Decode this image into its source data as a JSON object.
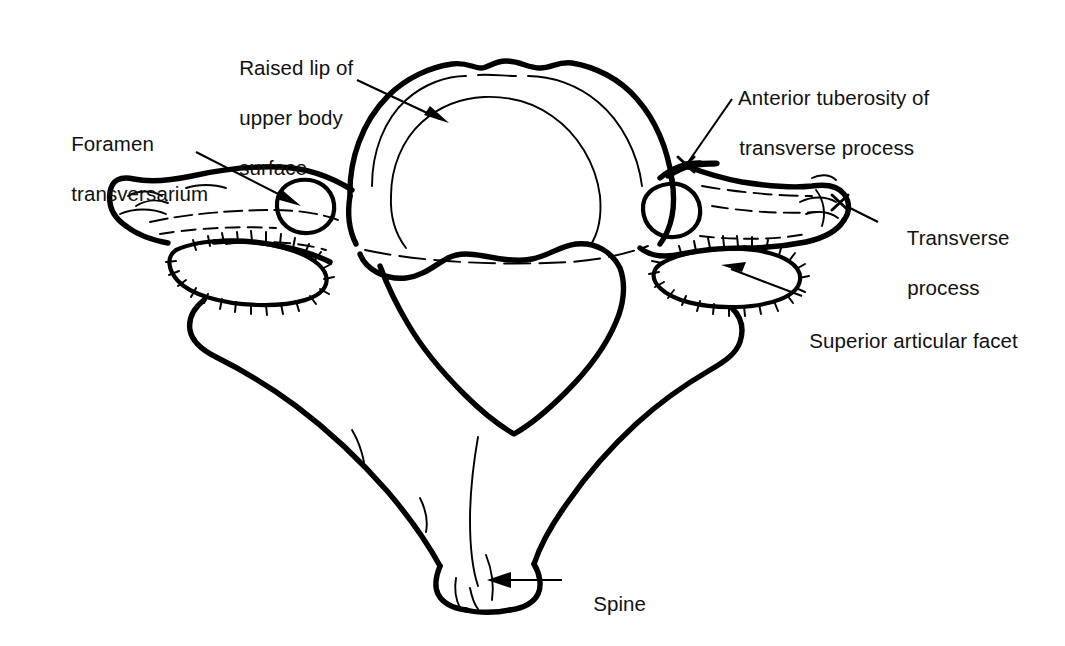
{
  "figure": {
    "background_color": "#ffffff",
    "ink_color": "#000000",
    "style": "black-and-white line drawing"
  },
  "labels": [
    {
      "id": "raised-lip",
      "text": "Raised lip of\nupper body\nsurface",
      "lines": [
        "Raised lip of",
        "upper body",
        "surface"
      ],
      "x": 216,
      "y": 30,
      "align": "left",
      "pointer": {
        "type": "arrow",
        "from_x": 357,
        "from_y": 80,
        "to_x": 447,
        "to_y": 122
      }
    },
    {
      "id": "foramen-transversarium",
      "text": "Foramen\ntransversarium",
      "lines": [
        "Foramen",
        "transversarium"
      ],
      "x": 48,
      "y": 106,
      "align": "left",
      "pointer": {
        "type": "arrow",
        "from_x": 196,
        "from_y": 152,
        "to_x": 299,
        "to_y": 205
      }
    },
    {
      "id": "anterior-tuberosity",
      "text": "Anterior tuberosity of\ntransverse process",
      "lines": [
        "Anterior tuberosity of",
        "transverse process"
      ],
      "x": 716,
      "y": 60,
      "align": "left",
      "pointer": {
        "type": "x-mark",
        "from_x": 730,
        "from_y": 100,
        "to_x": 686,
        "to_y": 164
      }
    },
    {
      "id": "transverse-process",
      "text": "Transverse\nprocess",
      "lines": [
        "Transverse",
        "process"
      ],
      "x": 884,
      "y": 200,
      "align": "left",
      "pointer": {
        "type": "x-mark",
        "from_x": 878,
        "from_y": 222,
        "to_x": 840,
        "to_y": 202
      }
    },
    {
      "id": "superior-articular-facet",
      "text": "Superior articular facet",
      "lines": [
        "Superior articular facet"
      ],
      "x": 786,
      "y": 303,
      "align": "left",
      "pointer": {
        "type": "arrow",
        "from_x": 800,
        "from_y": 297,
        "to_x": 722,
        "to_y": 265
      }
    },
    {
      "id": "spine",
      "text": "Spine",
      "lines": [
        "Spine"
      ],
      "x": 570,
      "y": 566,
      "align": "left",
      "pointer": {
        "type": "arrow",
        "from_x": 560,
        "from_y": 580,
        "to_x": 488,
        "to_y": 580
      }
    }
  ],
  "structures": [
    {
      "id": "vertebral-body",
      "name": "Vertebral body"
    },
    {
      "id": "vertebral-foramen",
      "name": "Vertebral foramen"
    },
    {
      "id": "spinous-process",
      "name": "Spinous process (spine)"
    },
    {
      "id": "left-transverse-process",
      "name": "Left transverse process"
    },
    {
      "id": "right-transverse-process",
      "name": "Right transverse process"
    },
    {
      "id": "left-foramen-transversarium",
      "name": "Left foramen transversarium"
    },
    {
      "id": "right-foramen-transversarium",
      "name": "Right foramen transversarium"
    },
    {
      "id": "left-superior-articular-facet",
      "name": "Left superior articular facet"
    },
    {
      "id": "right-superior-articular-facet",
      "name": "Right superior articular facet"
    }
  ]
}
